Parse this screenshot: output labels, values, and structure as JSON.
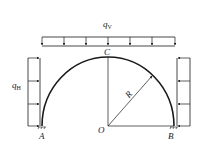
{
  "diagram": {
    "labels": {
      "qv": "q",
      "qv_sub": "V",
      "qh": "q",
      "qh_sub": "H",
      "top_point": "C",
      "center": "O",
      "left_support": "A",
      "right_support": "B",
      "radius": "R"
    },
    "colors": {
      "line": "#1a1a1a",
      "background": "#ffffff"
    }
  }
}
